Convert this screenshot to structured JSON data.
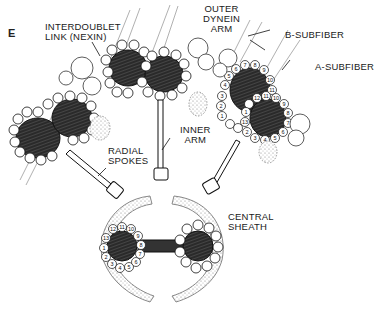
{
  "figure": {
    "panel_letter": "E",
    "colors": {
      "ink": "#1a1a1a",
      "fill_dark": "#2a2a2a",
      "paper": "#ffffff",
      "stipple": "#9a9a9a"
    }
  },
  "labels": {
    "interdoublet_link": "INTERDOUBLET\nLINK (NEXIN)",
    "outer_dynein_arm": "OUTER\nDYNEIN\nARM",
    "b_subfiber": "B-SUBFIBER",
    "a_subfiber": "A-SUBFIBER",
    "inner_arm": "INNER\nARM",
    "radial_spokes": "RADIAL\nSPOKES",
    "central_sheath": "CENTRAL\nSHEATH"
  },
  "protofilament_numbers": {
    "b_subfiber": [
      "1",
      "2",
      "3",
      "4",
      "5",
      "6",
      "7",
      "8",
      "9",
      "10",
      "11"
    ],
    "a_subfiber": [
      "1",
      "2",
      "3",
      "4",
      "5",
      "6",
      "7",
      "8",
      "9",
      "10",
      "11",
      "12",
      "13"
    ],
    "central_microtubule": [
      "1",
      "2",
      "3",
      "4",
      "5",
      "6",
      "7",
      "8",
      "9",
      "10",
      "11",
      "12",
      "13"
    ]
  }
}
